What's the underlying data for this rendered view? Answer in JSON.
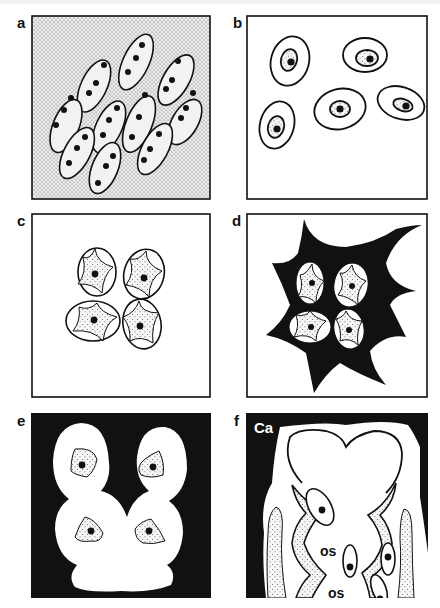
{
  "figure": {
    "panels": [
      {
        "id": "a",
        "label": "a",
        "description": "Stippled matrix containing ten elongated elliptical cells, each with two or three dark nuclei"
      },
      {
        "id": "b",
        "label": "b",
        "description": "Five oval cells on white background, each with stippled inner region and dark nucleus"
      },
      {
        "id": "c",
        "label": "c",
        "description": "Four-cell cluster; each rounded cell contains a stippled four-pointed concave shape with nucleus"
      },
      {
        "id": "d",
        "label": "d",
        "description": "Same four-cell cluster embedded in a black irregular star-shaped matrix"
      },
      {
        "id": "e",
        "label": "e",
        "description": "Black background with white lobed lacunar shape containing four triangular stippled cells with nuclei"
      },
      {
        "id": "f",
        "label": "f",
        "description": "Black calcified region with white heart-shaped space, stippled lining layers and elongated cells"
      }
    ],
    "annotations": {
      "f_calcified": "Ca",
      "f_osteocyte_1": "os",
      "f_osteocyte_2": "os"
    },
    "colors": {
      "ink": "#111111",
      "paper": "#ffffff",
      "stipple_bg": "#e2e2e2"
    }
  }
}
